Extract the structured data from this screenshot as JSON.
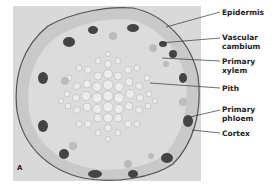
{
  "figure": {
    "panel_letter": "A",
    "labels": [
      {
        "id": "epidermis",
        "text": "Epidermis"
      },
      {
        "id": "vascular-cambium",
        "text": "Vascular cambium"
      },
      {
        "id": "primary-xylem",
        "text": "Primary xylem"
      },
      {
        "id": "pith",
        "text": "Pith"
      },
      {
        "id": "primary-phloem",
        "text": "Primary phloem"
      },
      {
        "id": "cortex",
        "text": "Cortex"
      }
    ]
  }
}
